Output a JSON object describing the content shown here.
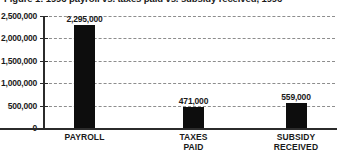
{
  "chart_data": {
    "type": "bar",
    "title": "Figure 1: 1996 payroll vs. taxes paid vs. subsidy received, 1996",
    "xlabel": "",
    "ylabel": "",
    "categories": [
      "PAYROLL",
      "TAXES\nPAID",
      "SUBSIDY\nRECEIVED"
    ],
    "values": [
      2295000,
      471000,
      559000
    ],
    "value_labels": [
      "2,295,000",
      "471,000",
      "559,000"
    ],
    "ylim": [
      0,
      2500000
    ],
    "yticks": [
      0,
      500000,
      1000000,
      1500000,
      2000000,
      2500000
    ],
    "ytick_labels": [
      "0",
      "500,000",
      "1,000,000",
      "1,500,000",
      "2,000,000",
      "2,500,000"
    ],
    "grid": true,
    "grid_style": "dashed",
    "legend": false,
    "bar_color": "#0d0d0d",
    "axis_color": "#2b2b2b",
    "grid_color": "#8d8d8d",
    "background": "#ffffff"
  }
}
